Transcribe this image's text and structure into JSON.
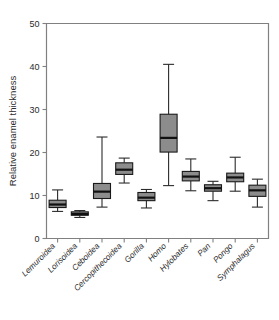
{
  "figure": {
    "background_color": "#ffffff",
    "box_fill_color": "#8c8c8c",
    "box_edge_color": "#1a1a1a",
    "median_color": "#111111",
    "axis_color": "#808080"
  },
  "chart_data": {
    "type": "box",
    "title": "",
    "subtitle": "",
    "xlabel": "",
    "ylabel": "Relative enamel thickness",
    "ylim": [
      0,
      50
    ],
    "yticks": [
      0,
      10,
      20,
      30,
      40,
      50
    ],
    "ytick_labels": [
      "0",
      "10",
      "20",
      "30",
      "40",
      "50"
    ],
    "grid": false,
    "legend": null,
    "legend_position": "none",
    "categories": [
      "Lemuroidea",
      "Lorisoidea",
      "Ceboidea",
      "Cercopithecoidea",
      "Gorilla",
      "Homo",
      "Hylobates",
      "Pan",
      "Pongo",
      "Symphalagus"
    ],
    "boxes": [
      {
        "category": "Lemuroidea",
        "whisker_low": 6.3,
        "q1": 7.2,
        "median": 7.9,
        "q3": 8.9,
        "whisker_high": 11.3
      },
      {
        "category": "Lorisoidea",
        "whisker_low": 4.9,
        "q1": 5.4,
        "median": 5.7,
        "q3": 6.2,
        "whisker_high": 6.5
      },
      {
        "category": "Ceboidea",
        "whisker_low": 7.3,
        "q1": 9.3,
        "median": 10.9,
        "q3": 12.8,
        "whisker_high": 23.6
      },
      {
        "category": "Cercopithecoidea",
        "whisker_low": 12.9,
        "q1": 14.9,
        "median": 16.0,
        "q3": 17.6,
        "whisker_high": 18.7
      },
      {
        "category": "Gorilla",
        "whisker_low": 7.1,
        "q1": 8.8,
        "median": 9.5,
        "q3": 10.7,
        "whisker_high": 11.4
      },
      {
        "category": "Homo",
        "whisker_low": 12.3,
        "q1": 20.1,
        "median": 23.4,
        "q3": 28.9,
        "whisker_high": 40.5
      },
      {
        "category": "Hylobates",
        "whisker_low": 11.1,
        "q1": 13.4,
        "median": 14.4,
        "q3": 15.6,
        "whisker_high": 18.5
      },
      {
        "category": "Pan",
        "whisker_low": 8.8,
        "q1": 11.0,
        "median": 11.7,
        "q3": 12.5,
        "whisker_high": 13.3
      },
      {
        "category": "Pongo",
        "whisker_low": 11.0,
        "q1": 13.2,
        "median": 14.2,
        "q3": 15.2,
        "whisker_high": 18.9
      },
      {
        "category": "Symphalagus",
        "whisker_low": 7.3,
        "q1": 9.8,
        "median": 11.2,
        "q3": 12.4,
        "whisker_high": 13.8
      }
    ]
  }
}
